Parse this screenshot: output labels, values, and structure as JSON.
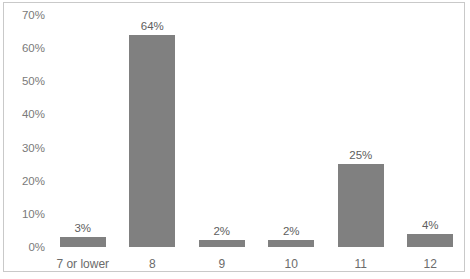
{
  "chart_data": {
    "type": "bar",
    "title": "",
    "subtitle": "",
    "xlabel": "",
    "ylabel": "",
    "categories": [
      "7 or lower",
      "8",
      "9",
      "10",
      "11",
      "12"
    ],
    "values": [
      3,
      64,
      2,
      2,
      25,
      4
    ],
    "value_labels": [
      "3%",
      "64%",
      "2%",
      "2%",
      "25%",
      "4%"
    ],
    "ylim": [
      0,
      70
    ],
    "ytick_values": [
      0,
      10,
      20,
      30,
      40,
      50,
      60,
      70
    ],
    "ytick_labels": [
      "0%",
      "10%",
      "20%",
      "30%",
      "40%",
      "50%",
      "60%",
      "70%"
    ],
    "grid": false,
    "legend": false,
    "legend_position": "none",
    "series": [
      {
        "name": "",
        "values": [
          3,
          64,
          2,
          2,
          25,
          4
        ]
      }
    ]
  },
  "style": {
    "bar_color": "#808080",
    "frame_color": "#c9c9c9",
    "tick_label_color": "#7a7a7a",
    "value_label_color": "#5e5e5e",
    "category_label_color": "#6b6b6b",
    "background_color": "#ffffff"
  }
}
